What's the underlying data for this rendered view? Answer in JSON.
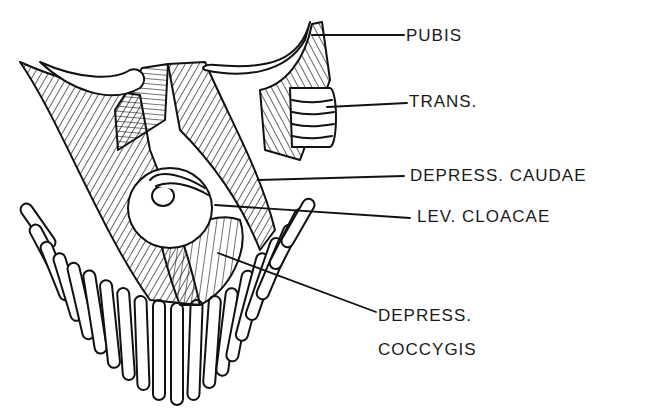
{
  "figure": {
    "type": "anatomical line drawing",
    "ink_color": "#111111",
    "background": "#ffffff"
  },
  "labels": [
    {
      "id": "pubis",
      "text": "PUBIS",
      "x": 406,
      "y": 26,
      "target": [
        312,
        35
      ]
    },
    {
      "id": "trans",
      "text": "TRANS.",
      "x": 409,
      "y": 92,
      "target": [
        327,
        107
      ]
    },
    {
      "id": "depress_caudae",
      "text": "DEPRESS. CAUDAE",
      "x": 410,
      "y": 166,
      "target": [
        258,
        180
      ]
    },
    {
      "id": "lev_cloacae",
      "text": "LEV. CLOACAE",
      "x": 417,
      "y": 207,
      "target": [
        215,
        205
      ]
    },
    {
      "id": "depress_coccygis_1",
      "text": "DEPRESS.",
      "x": 378,
      "y": 306,
      "target": [
        218,
        253
      ]
    },
    {
      "id": "depress_coccygis_2",
      "text": "COCCYGIS",
      "x": 378,
      "y": 340
    }
  ]
}
